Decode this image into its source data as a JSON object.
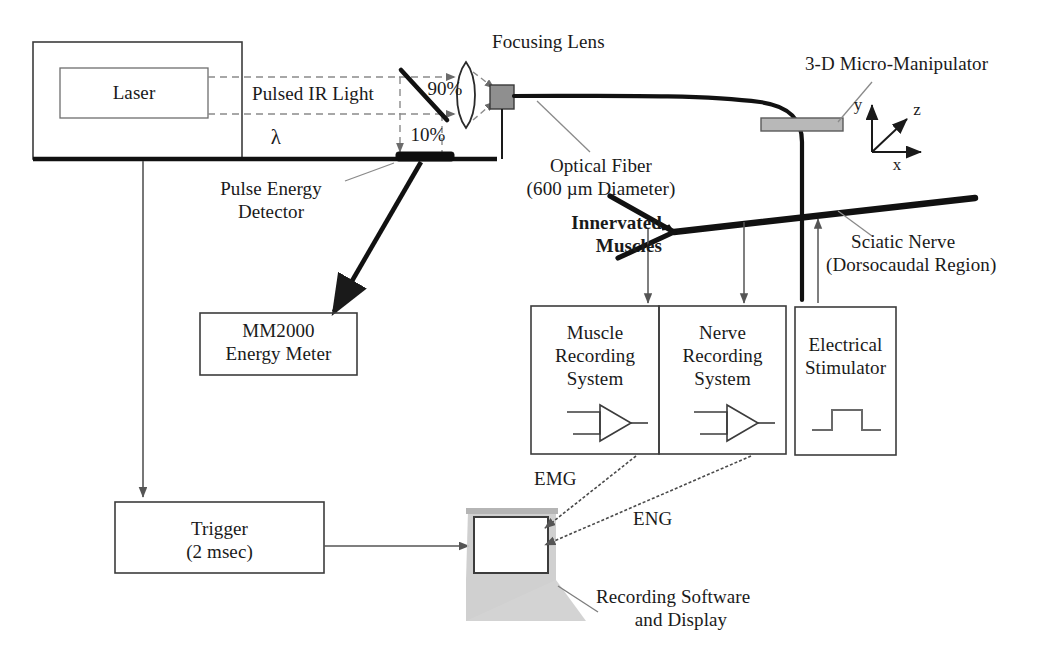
{
  "figure": {
    "type": "block-diagram",
    "background_color": "#ffffff",
    "line_color": "#1a1a1a",
    "gray_fill": "#9a9a9a",
    "laptop_gray": "#c9c9c9"
  },
  "boxes": {
    "laser_enclosure": {
      "label": ""
    },
    "laser": {
      "label": "Laser"
    },
    "energy_meter": {
      "line1": "MM2000",
      "line2": "Energy Meter"
    },
    "muscle_recording": {
      "line1": "Muscle",
      "line2": "Recording",
      "line3": "System",
      "icon": "amplifier-icon"
    },
    "nerve_recording": {
      "line1": "Nerve",
      "line2": "Recording",
      "line3": "System",
      "icon": "amplifier-icon"
    },
    "electrical_stimulator": {
      "line1": "Electrical",
      "line2": "Stimulator",
      "icon": "pulse-waveform-icon"
    },
    "trigger": {
      "line1": "Trigger",
      "line2": "(2 msec)"
    }
  },
  "labels": {
    "pulsed_ir_light": "Pulsed IR Light",
    "lambda": "λ",
    "split_90": "90%",
    "split_10": "10%",
    "focusing_lens": "Focusing Lens",
    "pulse_energy_detector": {
      "line1": "Pulse Energy",
      "line2": "Detector"
    },
    "optical_fiber": {
      "line1": "Optical Fiber",
      "line2": "(600 µm Diameter)"
    },
    "micro_manipulator": "3-D Micro-Manipulator",
    "innervated_muscles": {
      "line1": "Innervated",
      "line2": "Muscles"
    },
    "sciatic_nerve": {
      "line1": "Sciatic Nerve",
      "line2": "(Dorsocaudal Region)"
    },
    "emg": "EMG",
    "eng": "ENG",
    "recording_software": {
      "line1": "Recording Software",
      "line2": "and Display"
    }
  },
  "axes": {
    "x": "x",
    "y": "y",
    "z": "z"
  }
}
